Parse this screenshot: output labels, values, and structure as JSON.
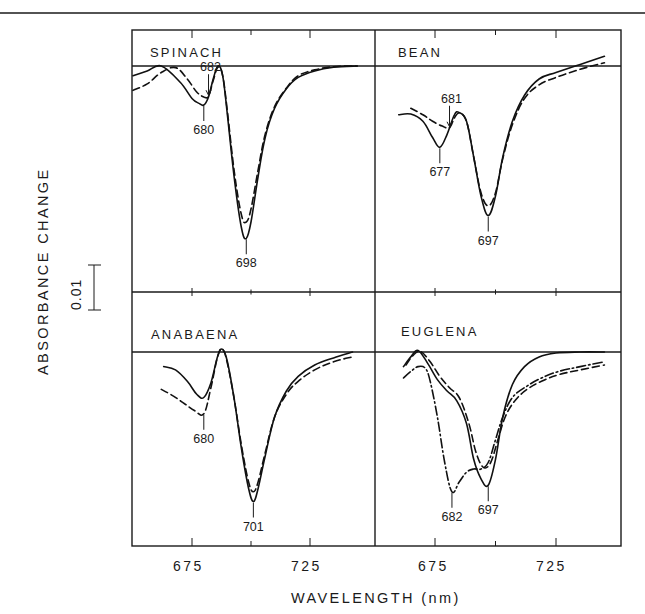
{
  "chart_data": {
    "type": "line",
    "figure": {
      "ylabel": "ABSORBANCE CHANGE",
      "xlabel": "WAVELENGTH (nm)",
      "scale_bar_label": "0.01",
      "x_tick_labels_left": [
        "675",
        "725"
      ],
      "x_tick_labels_right": [
        "675",
        "725"
      ],
      "grid": false,
      "layout": "2x2 panels"
    },
    "panels": [
      {
        "id": "spinach",
        "title": "SPINACH",
        "xlim": [
          650,
          750
        ],
        "peak_labels": [
          {
            "text": "682",
            "wavelength": 682,
            "series": "dashed",
            "placement": "above"
          },
          {
            "text": "680",
            "wavelength": 680,
            "series": "solid",
            "placement": "below"
          },
          {
            "text": "698",
            "wavelength": 698,
            "series": "solid",
            "placement": "below"
          }
        ],
        "series": [
          {
            "name": "solid",
            "style": "solid",
            "x": [
              650,
              656,
              662,
              670,
              675,
              678,
              680,
              682,
              684,
              686,
              688,
              690,
              693,
              696,
              698,
              700,
              703,
              706,
              710,
              715,
              720,
              727,
              735,
              745
            ],
            "y": [
              -0.003,
              -0.0015,
              0.0,
              -0.005,
              -0.01,
              -0.0115,
              -0.012,
              -0.0095,
              -0.004,
              0.0,
              -0.003,
              -0.015,
              -0.035,
              -0.05,
              -0.053,
              -0.048,
              -0.034,
              -0.022,
              -0.013,
              -0.007,
              -0.0035,
              -0.0015,
              -0.0004,
              0.0
            ]
          },
          {
            "name": "dashed",
            "style": "dashed",
            "x": [
              650,
              656,
              662,
              668,
              673,
              677,
              680,
              682,
              684,
              686,
              688,
              690,
              693,
              696,
              698,
              700,
              703,
              706,
              710,
              715,
              720,
              727,
              735,
              745
            ],
            "y": [
              -0.0075,
              -0.0055,
              -0.002,
              -0.0005,
              -0.004,
              -0.008,
              -0.0095,
              -0.0093,
              -0.0045,
              -0.0003,
              -0.003,
              -0.014,
              -0.033,
              -0.046,
              -0.048,
              -0.044,
              -0.032,
              -0.021,
              -0.0125,
              -0.0068,
              -0.003,
              -0.0012,
              -0.0002,
              0.0
            ]
          }
        ]
      },
      {
        "id": "bean",
        "title": "BEAN",
        "xlim": [
          650,
          750
        ],
        "peak_labels": [
          {
            "text": "681",
            "wavelength": 681,
            "series": "dashed",
            "placement": "above"
          },
          {
            "text": "677",
            "wavelength": 677,
            "series": "solid",
            "placement": "below"
          },
          {
            "text": "697",
            "wavelength": 697,
            "series": "solid",
            "placement": "below"
          }
        ],
        "series": [
          {
            "name": "solid",
            "style": "solid",
            "x": [
              660,
              665,
              670,
              674,
              677,
              680,
              683,
              685,
              688,
              691,
              694,
              697,
              700,
              703,
              707,
              712,
              718,
              725,
              735,
              745
            ],
            "y": [
              -0.015,
              -0.0148,
              -0.017,
              -0.022,
              -0.025,
              -0.021,
              -0.015,
              -0.0143,
              -0.017,
              -0.028,
              -0.04,
              -0.046,
              -0.04,
              -0.028,
              -0.017,
              -0.009,
              -0.004,
              -0.002,
              0.0005,
              0.003
            ]
          },
          {
            "name": "dashed",
            "style": "dashed",
            "x": [
              665,
              670,
              674,
              678,
              681,
              683,
              685,
              688,
              691,
              694,
              697,
              700,
              703,
              707,
              712,
              718,
              725,
              735,
              745
            ],
            "y": [
              -0.013,
              -0.015,
              -0.017,
              -0.0185,
              -0.019,
              -0.016,
              -0.0145,
              -0.017,
              -0.028,
              -0.039,
              -0.043,
              -0.039,
              -0.0285,
              -0.018,
              -0.01,
              -0.0058,
              -0.0035,
              -0.001,
              0.001
            ]
          }
        ]
      },
      {
        "id": "anabaena",
        "title": "ANABAENA",
        "xlim": [
          650,
          750
        ],
        "peak_labels": [
          {
            "text": "680",
            "wavelength": 680,
            "series": "dashed",
            "placement": "below"
          },
          {
            "text": "701",
            "wavelength": 701,
            "series": "solid",
            "placement": "below"
          }
        ],
        "series": [
          {
            "name": "solid",
            "style": "solid",
            "x": [
              663,
              668,
              673,
              677,
              680,
              683,
              686,
              688,
              690,
              693,
              696,
              699,
              701,
              703,
              706,
              710,
              715,
              720,
              727,
              735,
              743
            ],
            "y": [
              -0.0045,
              -0.0055,
              -0.009,
              -0.013,
              -0.014,
              -0.0095,
              -0.001,
              0.0008,
              -0.003,
              -0.015,
              -0.03,
              -0.042,
              -0.046,
              -0.042,
              -0.032,
              -0.02,
              -0.012,
              -0.0075,
              -0.004,
              -0.0018,
              0.0
            ]
          },
          {
            "name": "dashed",
            "style": "dashed",
            "x": [
              662,
              667,
              672,
              676,
              680,
              683,
              686,
              688,
              690,
              693,
              696,
              699,
              701,
              703,
              706,
              710,
              715,
              720,
              727,
              735,
              743
            ],
            "y": [
              -0.0115,
              -0.0135,
              -0.016,
              -0.018,
              -0.019,
              -0.011,
              -0.001,
              0.0008,
              -0.0035,
              -0.015,
              -0.029,
              -0.04,
              -0.043,
              -0.04,
              -0.031,
              -0.02,
              -0.013,
              -0.009,
              -0.0055,
              -0.003,
              -0.0015
            ]
          }
        ]
      },
      {
        "id": "euglena",
        "title": "EUGLENA",
        "xlim": [
          650,
          750
        ],
        "peak_labels": [
          {
            "text": "682",
            "wavelength": 682,
            "series": "dashdot",
            "placement": "below"
          },
          {
            "text": "697",
            "wavelength": 697,
            "series": "solid",
            "placement": "below"
          }
        ],
        "series": [
          {
            "name": "solid",
            "style": "solid",
            "x": [
              662,
              665,
              668,
              672,
              676,
              680,
              684,
              688,
              691,
              694,
              697,
              700,
              703,
              707,
              712,
              718,
              725,
              735,
              745
            ],
            "y": [
              -0.0045,
              -0.0015,
              0.0005,
              -0.0035,
              -0.0085,
              -0.012,
              -0.015,
              -0.022,
              -0.033,
              -0.039,
              -0.041,
              -0.033,
              -0.02,
              -0.01,
              -0.0045,
              -0.0015,
              -0.0003,
              0.0,
              0.0
            ]
          },
          {
            "name": "dashed",
            "style": "dashed",
            "x": [
              663,
              666,
              669,
              673,
              677,
              681,
              685,
              689,
              692,
              695,
              698,
              701,
              704,
              708,
              713,
              719,
              726,
              735,
              745
            ],
            "y": [
              -0.004,
              -0.001,
              0.0002,
              -0.003,
              -0.0075,
              -0.011,
              -0.014,
              -0.022,
              -0.031,
              -0.0355,
              -0.034,
              -0.027,
              -0.02,
              -0.015,
              -0.0115,
              -0.009,
              -0.007,
              -0.0055,
              -0.004
            ]
          },
          {
            "name": "dash-dot",
            "style": "dashdot",
            "x": [
              662,
              665,
              668,
              671,
              673,
              676,
              679,
              682,
              685,
              688,
              691,
              694,
              697,
              700,
              703,
              707,
              713,
              719,
              726,
              735,
              745
            ],
            "y": [
              -0.008,
              -0.006,
              -0.0045,
              -0.005,
              -0.009,
              -0.02,
              -0.034,
              -0.043,
              -0.04,
              -0.037,
              -0.036,
              -0.036,
              -0.034,
              -0.027,
              -0.02,
              -0.014,
              -0.0105,
              -0.008,
              -0.006,
              -0.0045,
              -0.003
            ]
          }
        ]
      }
    ]
  },
  "figure": {
    "ylabel": "ABSORBANCE CHANGE",
    "xlabel": "WAVELENGTH (nm)",
    "scale_bar_label": "0.01",
    "x_ticks": [
      "675",
      "725",
      "675",
      "725"
    ]
  }
}
